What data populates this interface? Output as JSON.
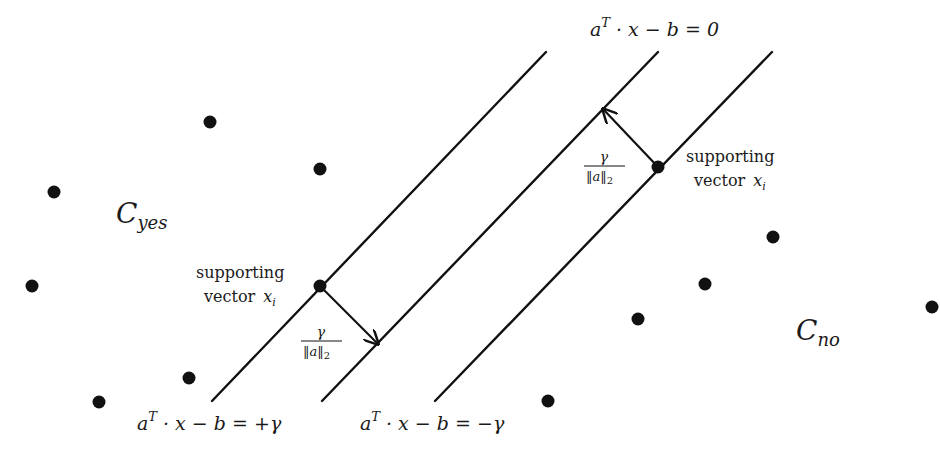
{
  "diagram": {
    "background": "#ffffff",
    "ink_color": "#111111",
    "hyperplanes": [
      {
        "id": "positive-margin",
        "label": "a^T · x − b = +γ",
        "x1": 212,
        "y1": 401,
        "x2": 546,
        "y2": 52
      },
      {
        "id": "decision-boundary",
        "label": "a^T · x − b = 0",
        "x1": 322,
        "y1": 401,
        "x2": 658,
        "y2": 52
      },
      {
        "id": "negative-margin",
        "label": "a^T · x − b = −γ",
        "x1": 435,
        "y1": 401,
        "x2": 772,
        "y2": 52
      }
    ],
    "labels": {
      "boundary_eq": {
        "a": "a",
        "sup": "T",
        "rest": " · x − b = 0"
      },
      "plus_eq": {
        "a": "a",
        "sup": "T",
        "rest": " · x − b = +γ"
      },
      "minus_eq": {
        "a": "a",
        "sup": "T",
        "rest": " · x − b = −γ"
      },
      "class_yes": {
        "main": "C",
        "sub": "yes"
      },
      "class_no": {
        "main": "C",
        "sub": "no"
      },
      "support_left": {
        "line1": "supporting",
        "line2": "vector",
        "var": "x",
        "sub": "i"
      },
      "support_right": {
        "line1": "supporting",
        "line2": "vector",
        "var": "x",
        "sub": "i"
      },
      "margin_left": {
        "numerator": "γ",
        "denominator": "‖a‖",
        "den_sub": "2"
      },
      "margin_right": {
        "numerator": "γ",
        "denominator": "‖a‖",
        "den_sub": "2"
      }
    },
    "margin_arrows": [
      {
        "id": "left-margin-arrow",
        "from": [
          320,
          286
        ],
        "to": [
          378,
          344
        ]
      },
      {
        "id": "right-margin-arrow",
        "from": [
          658,
          167
        ],
        "to": [
          603,
          109
        ]
      }
    ],
    "points_yes": [
      {
        "x": 210,
        "y": 122
      },
      {
        "x": 320,
        "y": 169
      },
      {
        "x": 54,
        "y": 192
      },
      {
        "x": 32,
        "y": 286
      },
      {
        "x": 189,
        "y": 378
      },
      {
        "x": 99,
        "y": 402
      }
    ],
    "points_no": [
      {
        "x": 773,
        "y": 237
      },
      {
        "x": 705,
        "y": 284
      },
      {
        "x": 638,
        "y": 319
      },
      {
        "x": 932,
        "y": 307
      },
      {
        "x": 548,
        "y": 401
      }
    ],
    "support_vectors": [
      {
        "x": 320,
        "y": 286,
        "class": "yes"
      },
      {
        "x": 658,
        "y": 167,
        "class": "no"
      }
    ]
  }
}
